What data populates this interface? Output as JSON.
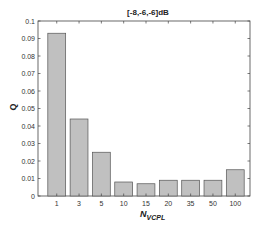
{
  "chart_data": {
    "type": "bar",
    "title": "[-8,-6,-6]dB",
    "xlabel": "N_VCPL",
    "xlabel_main": "N",
    "xlabel_sub": "VCPL",
    "ylabel": "Q",
    "categories": [
      "1",
      "3",
      "5",
      "10",
      "15",
      "20",
      "35",
      "50",
      "100"
    ],
    "values": [
      0.093,
      0.044,
      0.025,
      0.008,
      0.007,
      0.009,
      0.009,
      0.009,
      0.015
    ],
    "ylim": [
      0,
      0.1
    ],
    "yticks": [
      "0",
      "0.01",
      "0.02",
      "0.03",
      "0.04",
      "0.05",
      "0.06",
      "0.07",
      "0.08",
      "0.09",
      "0.1"
    ],
    "grid": false,
    "legend": null,
    "bar_color": "#c0c0c0",
    "bar_edge": "#555555"
  }
}
